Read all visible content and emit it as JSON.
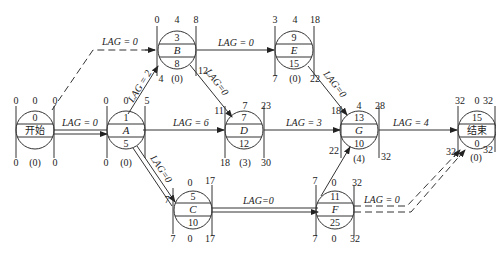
{
  "diagram": {
    "type": "single-code network (activity-on-node) with time parameters",
    "nodes": [
      {
        "id": "start",
        "label": "开始",
        "duration": "0",
        "es": "0",
        "tf": "0",
        "ef": "0",
        "ls": "0",
        "ff": "(0)",
        "lf": "0",
        "top_mid": "0"
      },
      {
        "id": "A",
        "label": "A",
        "top": "1",
        "duration": "5",
        "es": "0",
        "tf": "0",
        "ef": "5",
        "ls": "0",
        "ff": "(0)",
        "lf": "5"
      },
      {
        "id": "B",
        "label": "B",
        "top": "3",
        "duration": "8",
        "es": "0",
        "tf": "4",
        "ef": "8",
        "ls": "4",
        "ff": "(0)",
        "lf": "12"
      },
      {
        "id": "E",
        "label": "E",
        "top": "9",
        "duration": "15",
        "es": "3",
        "tf": "4",
        "ef": "18",
        "ls": "7",
        "ff": "(0)",
        "lf": "22"
      },
      {
        "id": "D",
        "label": "D",
        "top": "7",
        "duration": "12",
        "es": "11",
        "tf": "7",
        "ef": "23",
        "ls": "18",
        "ff": "(3)",
        "lf": "30"
      },
      {
        "id": "G",
        "label": "G",
        "top": "13",
        "duration": "10",
        "es": "18",
        "tf": "4",
        "ef": "28",
        "ls": "22",
        "ff": "(4)",
        "lf": "32"
      },
      {
        "id": "C",
        "label": "C",
        "top": "5",
        "duration": "10",
        "es": "7",
        "tf": "0",
        "ef": "17",
        "ls": "7",
        "ff": "0",
        "lf": "17"
      },
      {
        "id": "F",
        "label": "F",
        "top": "11",
        "duration": "25",
        "es": "7",
        "tf": "0",
        "ef": "32",
        "ls": "7",
        "ff": "0",
        "lf": "32"
      },
      {
        "id": "end",
        "label": "结束",
        "top": "15",
        "duration": "0",
        "es": "32",
        "tf": "0",
        "ef": "32",
        "ls": "32",
        "ff": "(0)",
        "lf": "32"
      }
    ],
    "edges": [
      {
        "from": "start",
        "to": "A",
        "lag": "LAG = 0",
        "style": "double"
      },
      {
        "from": "start",
        "to": "B",
        "lag": "LAG = 0",
        "style": "dashed"
      },
      {
        "from": "A",
        "to": "B",
        "lag": "LAG = 2",
        "style": "solid"
      },
      {
        "from": "A",
        "to": "D",
        "lag": "LAG = 6",
        "style": "solid"
      },
      {
        "from": "A",
        "to": "C",
        "lag": "LAG = 0",
        "style": "double"
      },
      {
        "from": "B",
        "to": "E",
        "lag": "LAG = 0",
        "style": "solid"
      },
      {
        "from": "B",
        "to": "D",
        "lag": "LAG = 0",
        "style": "solid"
      },
      {
        "from": "E",
        "to": "G",
        "lag": "LAG = 0",
        "style": "solid"
      },
      {
        "from": "D",
        "to": "G",
        "lag": "LAG = 3",
        "style": "solid"
      },
      {
        "from": "C",
        "to": "F",
        "lag": "LAG = 0",
        "style": "double"
      },
      {
        "from": "F",
        "to": "G",
        "lag": "",
        "style": "solid"
      },
      {
        "from": "G",
        "to": "end",
        "lag": "LAG = 4",
        "style": "solid"
      },
      {
        "from": "F",
        "to": "end",
        "lag": "LAG = 0",
        "style": "double-dashed"
      }
    ]
  },
  "labels": {
    "lag0": "LAG = 0",
    "lag2": "LAG = 2",
    "lag6": "LAG = 6",
    "lag3": "LAG = 3",
    "lag4": "LAG = 4",
    "lag0b": "LAG=0"
  }
}
